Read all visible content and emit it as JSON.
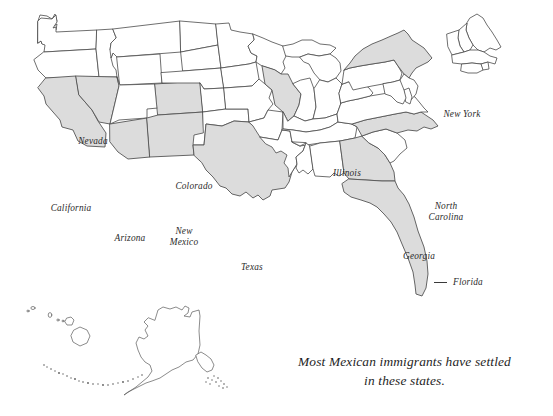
{
  "map": {
    "title_text": "",
    "background_color": "#ffffff",
    "highlight_fill": "#dcdcdc",
    "default_fill": "#ffffff",
    "border_color": "#4a4a4a",
    "highlighted_states": [
      "California",
      "Nevada",
      "Arizona",
      "New Mexico",
      "Colorado",
      "Texas",
      "Illinois",
      "New York",
      "North Carolina",
      "Georgia",
      "Florida"
    ],
    "labels": {
      "nevada": "Nevada",
      "california": "California",
      "arizona": "Arizona",
      "colorado": "Colorado",
      "new_mexico_line1": "New",
      "new_mexico_line2": "Mexico",
      "texas": "Texas",
      "illinois": "Illinois",
      "new_york": "New York",
      "north_carolina_line1": "North",
      "north_carolina_line2": "Carolina",
      "georgia": "Georgia",
      "florida": "Florida"
    }
  },
  "caption": {
    "line1": "Most Mexican immigrants have settled",
    "line2": "in these states."
  }
}
